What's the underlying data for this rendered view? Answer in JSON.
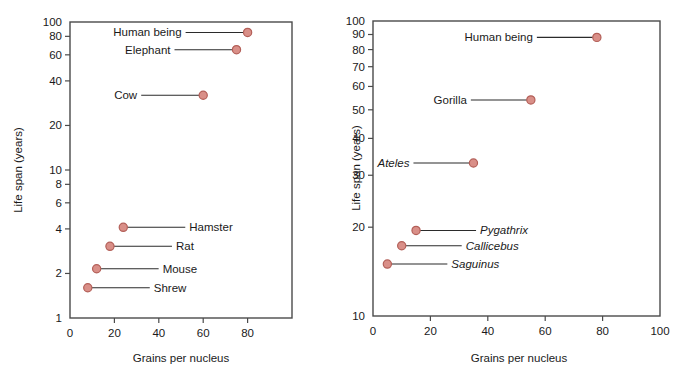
{
  "figure": {
    "marker_fill": "#d98f88",
    "marker_stroke": "#b35f58",
    "axis_color": "#4a4a4a",
    "leader_color": "#2b2b2b"
  },
  "chart_data": [
    {
      "type": "scatter",
      "panel": "left",
      "title": "",
      "xlabel": "Grains per nucleus",
      "ylabel": "Life span (years)",
      "xscale": "linear",
      "yscale": "log",
      "xlim": [
        0,
        100
      ],
      "ylim": [
        1,
        100
      ],
      "grid": false,
      "legend": "none",
      "xticks": [
        0,
        20,
        40,
        60,
        80,
        100
      ],
      "xticklabels": [
        "0",
        "20",
        "40",
        "60",
        "80",
        ""
      ],
      "yticks": [
        1,
        2,
        4,
        6,
        8,
        10,
        20,
        40,
        60,
        80,
        100
      ],
      "yticklabels": [
        "1",
        "2",
        "4",
        "6",
        "8",
        "10",
        "20",
        "40",
        "60",
        "80",
        "100"
      ],
      "points": [
        {
          "label": "Human being",
          "x": 80,
          "y": 85,
          "italic": false,
          "label_side": "left"
        },
        {
          "label": "Elephant",
          "x": 75,
          "y": 65,
          "italic": false,
          "label_side": "left"
        },
        {
          "label": "Cow",
          "x": 60,
          "y": 32,
          "italic": false,
          "label_side": "left"
        },
        {
          "label": "Hamster",
          "x": 24,
          "y": 4.1,
          "italic": false,
          "label_side": "right"
        },
        {
          "label": "Rat",
          "x": 18,
          "y": 3.05,
          "italic": false,
          "label_side": "right"
        },
        {
          "label": "Mouse",
          "x": 12,
          "y": 2.15,
          "italic": false,
          "label_side": "right"
        },
        {
          "label": "Shrew",
          "x": 8,
          "y": 1.6,
          "italic": false,
          "label_side": "right"
        }
      ]
    },
    {
      "type": "scatter",
      "panel": "right",
      "title": "",
      "xlabel": "Grains per nucleus",
      "ylabel": "Life span (years)",
      "xscale": "linear",
      "yscale": "log",
      "xlim": [
        0,
        100
      ],
      "ylim": [
        10,
        100
      ],
      "grid": false,
      "legend": "none",
      "xticks": [
        0,
        20,
        40,
        60,
        80,
        100
      ],
      "xticklabels": [
        "0",
        "20",
        "40",
        "60",
        "80",
        "100"
      ],
      "yticks": [
        10,
        20,
        30,
        40,
        50,
        60,
        70,
        80,
        90,
        100
      ],
      "yticklabels": [
        "10",
        "20",
        "30",
        "40",
        "50",
        "60",
        "70",
        "80",
        "90",
        "100"
      ],
      "points": [
        {
          "label": "Human being",
          "x": 78,
          "y": 88,
          "italic": false,
          "label_side": "left"
        },
        {
          "label": "Gorilla",
          "x": 55,
          "y": 54,
          "italic": false,
          "label_side": "left"
        },
        {
          "label": "Ateles",
          "x": 35,
          "y": 33,
          "italic": true,
          "label_side": "left"
        },
        {
          "label": "Pygathrix",
          "x": 15,
          "y": 19.5,
          "italic": true,
          "label_side": "right"
        },
        {
          "label": "Callicebus",
          "x": 10,
          "y": 17.3,
          "italic": true,
          "label_side": "right"
        },
        {
          "label": "Saguinus",
          "x": 5,
          "y": 15,
          "italic": true,
          "label_side": "right"
        }
      ]
    }
  ]
}
